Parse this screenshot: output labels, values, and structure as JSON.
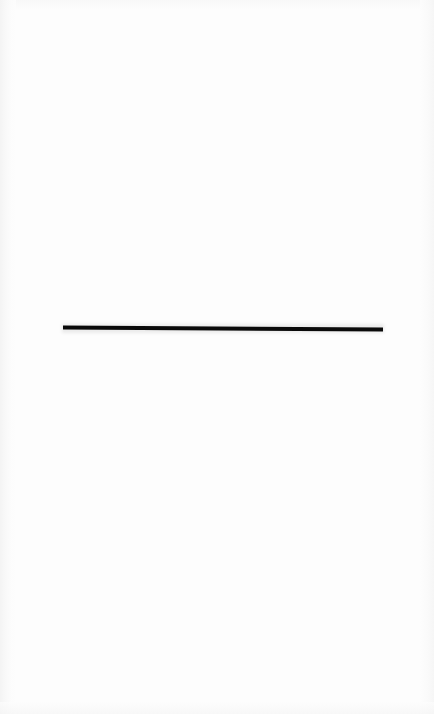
{
  "page": {
    "kind": "scanned-blank-page",
    "width": 434,
    "height": 714,
    "background_color": "#fdfdfd",
    "paper_color": "#ffffff",
    "text_content": "",
    "caption": ""
  },
  "marks": {
    "horizontal_rule": {
      "label": "horizontal-rule",
      "color": "#0a0a0a",
      "x_start": 63,
      "x_end": 383,
      "y_start": 327,
      "y_end": 330,
      "thickness": 4,
      "length": 320
    }
  },
  "scan_artifacts": {
    "left_edge_shadow_color": "#f2f2f2",
    "right_edge_shadow_color": "#f4f4f4",
    "top_edge_shadow_color": "#f6f6f6",
    "bottom_edge_shadow_color": "#f5f5f5"
  }
}
